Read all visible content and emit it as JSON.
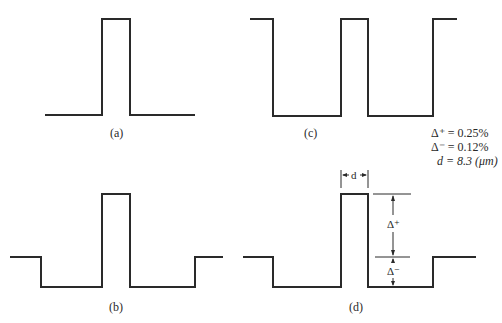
{
  "figure": {
    "panels": [
      {
        "id": "a",
        "label": "(a)",
        "description": "step-index profile: single pulse on flat baseline"
      },
      {
        "id": "b",
        "label": "(b)",
        "description": "W-profile: central pulse with depressed inner cladding and raised outer shoulders"
      },
      {
        "id": "c",
        "label": "(c)",
        "description": "periodic square profile"
      },
      {
        "id": "d",
        "label": "(d)",
        "description": "W-profile with dimension annotations"
      }
    ],
    "parameters": {
      "delta_plus": "Δ⁺ = 0.25%",
      "delta_minus": "Δ⁻ = 0.12%",
      "d": "d = 8.3 (μm)"
    },
    "annotations": {
      "d_label": "d",
      "delta_plus_label": "Δ⁺",
      "delta_minus_label": "Δ⁻"
    },
    "colors": {
      "line": "#2a2a2a",
      "background": "#ffffff"
    }
  }
}
